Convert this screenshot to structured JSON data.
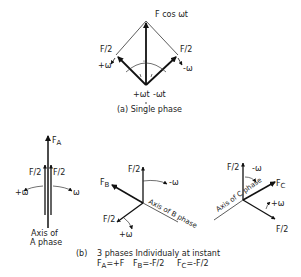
{
  "part_a": {
    "resultant_label": "F cos ωt",
    "left_component_label": "F/2",
    "right_component_label": "F/2",
    "left_rotation_label": "+ω",
    "right_rotation_label": "-ω",
    "left_angle_label": "+ωt",
    "right_angle_label": "-ωt",
    "caption": "(a)  Single phase"
  },
  "part_b": {
    "phase_a": {
      "resultant_label": "F",
      "resultant_sub": "A",
      "left_component_label": "F/2",
      "right_component_label": "F/2",
      "left_rotation_label": "+ω",
      "right_rotation_label": "ω",
      "axis_line1": "Axis of",
      "axis_line2": "A phase"
    },
    "phase_b": {
      "up_component_label": "F/2",
      "resultant_label": "F",
      "resultant_sub": "B",
      "down_component_label": "F/2",
      "rotation_up_label": "-ω",
      "rotation_down_label": "+ω",
      "axis_label": "Axis of B phase"
    },
    "phase_c": {
      "up_component_label": "F/2",
      "resultant_label": "F",
      "resultant_sub": "C",
      "down_component_label": "F/2",
      "rotation_up_label": "-ω",
      "rotation_down_label": "+ω",
      "axis_label": "Axis of C phase"
    },
    "caption_prefix": "(b)",
    "caption_text": "3 phases  Individualy  at  instant",
    "instant_a": "F",
    "instant_a_sub": "A",
    "instant_a_val": "=+F",
    "instant_b": "F",
    "instant_b_sub": "B",
    "instant_b_val": "=-F/2",
    "instant_c": "F",
    "instant_c_sub": "C",
    "instant_c_val": "=-F/2"
  }
}
